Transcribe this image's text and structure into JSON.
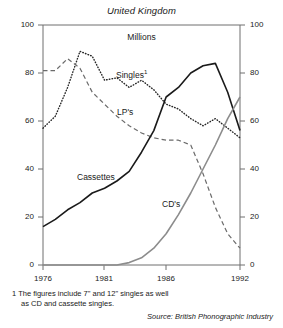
{
  "chart_data": {
    "type": "line",
    "title": "United Kingdom",
    "subtitle": "Millions",
    "xlabel": "",
    "ylabel": "Millions",
    "xlim": [
      1976,
      1992
    ],
    "ylim": [
      0,
      100
    ],
    "grid": false,
    "legend": "inline-labels",
    "x": [
      1976,
      1977,
      1978,
      1979,
      1980,
      1981,
      1982,
      1983,
      1984,
      1985,
      1986,
      1987,
      1988,
      1989,
      1990,
      1991,
      1992
    ],
    "x_ticks": [
      1976,
      1981,
      1986,
      1992
    ],
    "y_ticks": [
      0,
      20,
      40,
      60,
      80,
      100
    ],
    "series": [
      {
        "name": "Singles",
        "name_display": "Singles",
        "footnote_marker": "1",
        "style": "dotted",
        "color": "#262626",
        "values": [
          57,
          62,
          74,
          89,
          87,
          77,
          78,
          74,
          77,
          73,
          67,
          65,
          61,
          58,
          61,
          57,
          53
        ]
      },
      {
        "name": "LP's",
        "name_display": "LP's",
        "style": "dashed",
        "color": "#6b6b6b",
        "values": [
          81,
          81,
          86,
          82,
          72,
          67,
          62,
          58,
          55,
          53,
          52,
          52,
          50,
          38,
          24,
          13,
          7
        ]
      },
      {
        "name": "Cassettes",
        "name_display": "Cassettes",
        "style": "solid",
        "color": "#1a1a1a",
        "values": [
          16,
          19,
          23,
          26,
          30,
          32,
          35,
          39,
          47,
          56,
          70,
          74,
          80,
          83,
          84,
          72,
          56
        ]
      },
      {
        "name": "CD's",
        "name_display": "CD's",
        "style": "solid-grey",
        "color": "#8c8c8c",
        "values": [
          0,
          0,
          0,
          0,
          0,
          0,
          0,
          1,
          3,
          7,
          13,
          21,
          30,
          40,
          50,
          61,
          70
        ]
      }
    ],
    "axis_labels_left": [
      "100",
      "80",
      "60",
      "40",
      "20",
      "0"
    ],
    "axis_labels_right": [
      "100",
      "80",
      "60",
      "40",
      "20",
      "0"
    ],
    "x_tick_labels": [
      "1976",
      "1981",
      "1986",
      "1992"
    ],
    "footnote_marker": "1",
    "footnote_line1": "The figures include 7\" and 12\" singles as well",
    "footnote_line2": "as CD and cassette singles.",
    "source": "Source: British Phonographic Industry"
  }
}
